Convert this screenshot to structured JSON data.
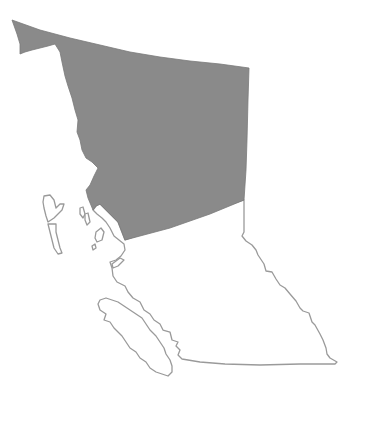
{
  "map": {
    "subject": "British Columbia",
    "colors": {
      "background": "#ffffff",
      "shaded_region": "#8a8a8a",
      "outline": "#9a9a9a"
    },
    "regions": [
      {
        "name": "Northern region",
        "state": "shaded"
      },
      {
        "name": "Southern region",
        "state": "unshaded"
      },
      {
        "name": "Vancouver Island",
        "state": "unshaded"
      },
      {
        "name": "Haida Gwaii",
        "state": "unshaded"
      }
    ]
  }
}
